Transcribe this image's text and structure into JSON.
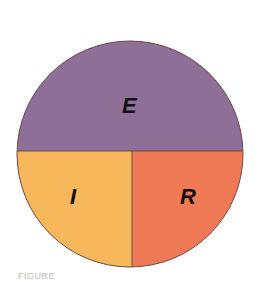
{
  "diagram": {
    "type": "divided-circle",
    "regions": [
      {
        "label": "E",
        "position": "top-half",
        "color": "#8e6f98"
      },
      {
        "label": "I",
        "position": "bottom-left-quarter",
        "color": "#f6b85a"
      },
      {
        "label": "R",
        "position": "bottom-right-quarter",
        "color": "#f07a55"
      }
    ],
    "outline_color": "#6a4a4a"
  },
  "caption": {
    "text": "FIGURE"
  }
}
